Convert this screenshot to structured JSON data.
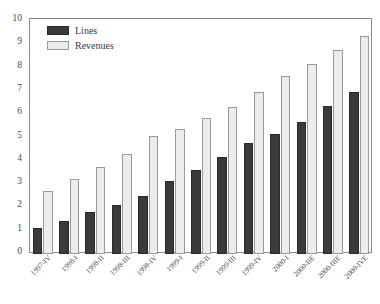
{
  "chart_data": {
    "type": "bar",
    "title": "",
    "subtitle": "",
    "xlabel": "",
    "ylabel": "",
    "ylim": [
      0,
      10
    ],
    "yticks": [
      0,
      1,
      2,
      3,
      4,
      5,
      6,
      7,
      8,
      9,
      10
    ],
    "grid": false,
    "legend_position": "top-left",
    "categories": [
      "1997-IV",
      "1998-I",
      "1998-II",
      "1998-III",
      "1998-IV",
      "1999-I",
      "1999-II",
      "1999-III",
      "1999-IV",
      "2000-I",
      "2000-IIE",
      "2000-IIIE",
      "2000-IVE"
    ],
    "series": [
      {
        "name": "Lines",
        "color": "#3a3a3a",
        "values": [
          1.1,
          1.4,
          1.8,
          2.1,
          2.5,
          3.15,
          3.6,
          4.15,
          4.75,
          5.15,
          5.65,
          6.35,
          6.95
        ]
      },
      {
        "name": "Revenues",
        "color": "#ececec",
        "values": [
          2.7,
          3.2,
          3.75,
          4.3,
          5.05,
          5.35,
          5.85,
          6.3,
          6.95,
          7.65,
          8.15,
          8.75,
          9.35
        ]
      }
    ]
  }
}
